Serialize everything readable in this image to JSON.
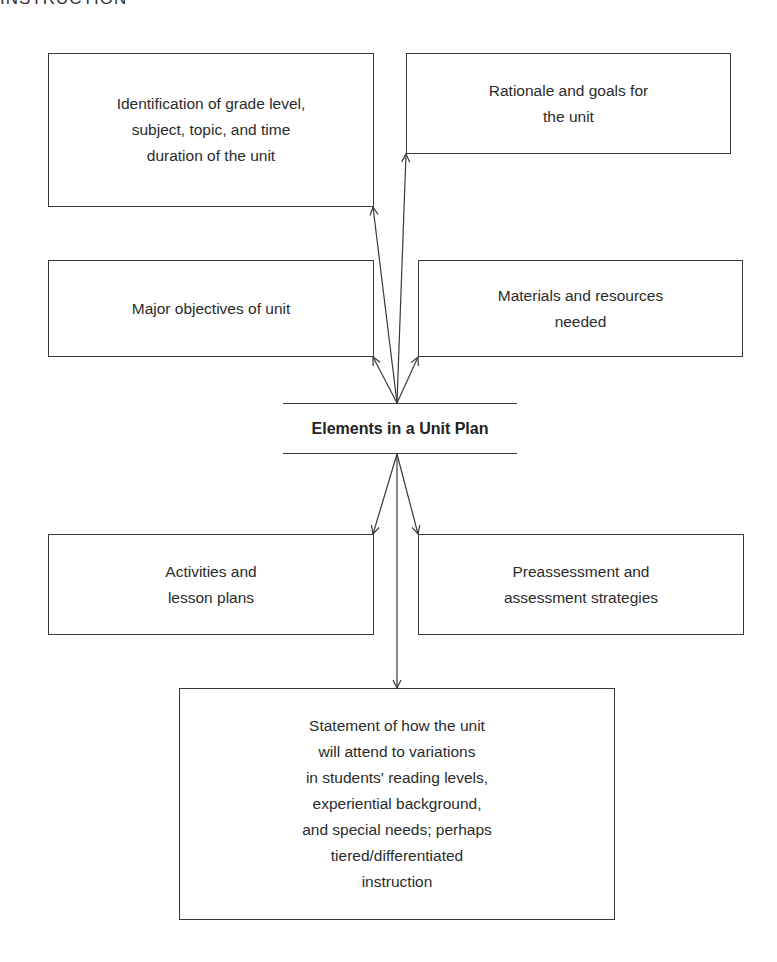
{
  "running_header": "INSTRUCTION",
  "diagram": {
    "center": {
      "title": "Elements in a Unit Plan"
    },
    "boxes": [
      {
        "id": "identification",
        "label": "Identification of grade level,\nsubject, topic, and time\nduration of the unit"
      },
      {
        "id": "rationale",
        "label": "Rationale and goals for\nthe unit"
      },
      {
        "id": "objectives",
        "label": "Major objectives of unit"
      },
      {
        "id": "materials",
        "label": "Materials and resources\nneeded"
      },
      {
        "id": "activities",
        "label": "Activities and\nlesson plans"
      },
      {
        "id": "assessment",
        "label": "Preassessment and\nassessment strategies"
      },
      {
        "id": "variations",
        "label": "Statement of how the unit\nwill attend to variations\nin students' reading levels,\nexperiential background,\nand special needs; perhaps\ntiered/differentiated\ninstruction"
      }
    ],
    "connectors": [
      {
        "from": "center",
        "to": "identification",
        "type": "arrow"
      },
      {
        "from": "center",
        "to": "rationale",
        "type": "arrow"
      },
      {
        "from": "center",
        "to": "objectives",
        "type": "arrow"
      },
      {
        "from": "center",
        "to": "materials",
        "type": "arrow"
      },
      {
        "from": "center",
        "to": "activities",
        "type": "arrow"
      },
      {
        "from": "center",
        "to": "assessment",
        "type": "arrow"
      },
      {
        "from": "center",
        "to": "variations",
        "type": "arrow"
      }
    ],
    "colors": {
      "line": "#3a3a3a",
      "text": "#2b2b2b",
      "background": "#ffffff"
    }
  }
}
